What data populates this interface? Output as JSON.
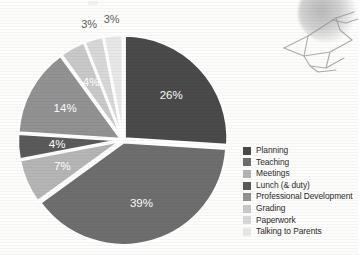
{
  "chart_data": {
    "type": "pie",
    "title": "",
    "categories": [
      "Planning",
      "Teaching",
      "Meetings",
      "Lunch (& duty)",
      "Professional Development",
      "Grading",
      "Paperwork",
      "Talking to Parents"
    ],
    "values": [
      26,
      39,
      7,
      4,
      14,
      4,
      3,
      3
    ],
    "value_labels": [
      "26%",
      "39%",
      "7%",
      "4%",
      "14%",
      "4%",
      "3%",
      "3%"
    ],
    "unit": "percent",
    "colors": [
      "#4a4a4a",
      "#6e6e6e",
      "#b5b5b5",
      "#5a5a5a",
      "#929292",
      "#c9c9c9",
      "#d8d8d8",
      "#e8e8e8"
    ],
    "exploded": true,
    "legend_position": "right",
    "grid": false,
    "xlabel": "",
    "ylabel": "",
    "slices": [
      {
        "label": "Planning",
        "value": 26,
        "text": "26%",
        "color": "#4a4a4a",
        "label_color": "#ffffff",
        "label_inside": true
      },
      {
        "label": "Teaching",
        "value": 39,
        "text": "39%",
        "color": "#6e6e6e",
        "label_color": "#ffffff",
        "label_inside": true
      },
      {
        "label": "Meetings",
        "value": 7,
        "text": "7%",
        "color": "#b5b5b5",
        "label_color": "#ffffff",
        "label_inside": true
      },
      {
        "label": "Lunch (& duty)",
        "value": 4,
        "text": "4%",
        "color": "#5a5a5a",
        "label_color": "#ffffff",
        "label_inside": true
      },
      {
        "label": "Professional Development",
        "value": 14,
        "text": "14%",
        "color": "#929292",
        "label_color": "#ffffff",
        "label_inside": true
      },
      {
        "label": "Grading",
        "value": 4,
        "text": "4%",
        "color": "#c9c9c9",
        "label_color": "#ffffff",
        "label_inside": true
      },
      {
        "label": "Paperwork",
        "value": 3,
        "text": "3%",
        "color": "#d8d8d8",
        "label_color": "#5e5e5e",
        "label_inside": false
      },
      {
        "label": "Talking to Parents",
        "value": 3,
        "text": "3%",
        "color": "#e8e8e8",
        "label_color": "#5e5e5e",
        "label_inside": false
      }
    ]
  },
  "legend": {
    "items": [
      {
        "label": "Planning",
        "color": "#4a4a4a"
      },
      {
        "label": "Teaching",
        "color": "#6e6e6e"
      },
      {
        "label": "Meetings",
        "color": "#b5b5b5"
      },
      {
        "label": "Lunch (& duty)",
        "color": "#5a5a5a"
      },
      {
        "label": "Professional Development",
        "color": "#929292"
      },
      {
        "label": "Grading",
        "color": "#c9c9c9"
      },
      {
        "label": "Paperwork",
        "color": "#d8d8d8"
      },
      {
        "label": "Talking to Parents",
        "color": "#e8e8e8"
      }
    ]
  },
  "decoration": {
    "sketch_name": "hand-line-drawing",
    "sketch_color": "#8e8e8e"
  },
  "page": {
    "background": "#ffffff"
  }
}
